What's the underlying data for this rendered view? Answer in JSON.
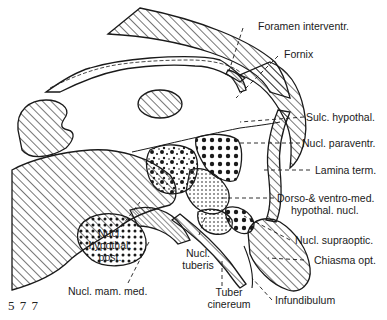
{
  "figure": {
    "number": "5 7 7",
    "type": "anatomical line illustration"
  },
  "labels": {
    "foramen": "Foramen interventr.",
    "fornix": "Fornix",
    "sulc_hypothal": "Sulc. hypothal.",
    "nucl_paraventr": "Nucl. paraventr.",
    "lamina_term": "Lamina term.",
    "dorso_ventro_1": "Dorso-& ventro-med.",
    "dorso_ventro_2": "hypothal. nucl.",
    "nucl_supraoptic": "Nucl. supraoptic.",
    "chiasma_opt": "Chiasma opt.",
    "infundibulum": "Infundibulum",
    "tuber_1": "Tuber",
    "tuber_2": "cinereum",
    "nucl_tuberis_1": "Nucl.",
    "nucl_tuberis_2": "tuberis",
    "nucl_mam_med": "Nucl. mam. med.",
    "nucl_hyp_post_1": "Nucl.",
    "nucl_hyp_post_2": "hypothal.",
    "nucl_hyp_post_3": "post."
  },
  "colors": {
    "ink": "#1a1a1a",
    "background": "#ffffff"
  }
}
